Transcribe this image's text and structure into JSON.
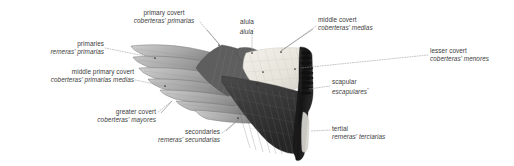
{
  "figure": {
    "background_color": "#ffffff",
    "text_color": "#3c3c3c",
    "leader_line_color": "#9a9a9a",
    "wing_colors": {
      "primaries_light": "#b9b9b9",
      "primaries_mid": "#9a9a9a",
      "primaries_dark": "#6f6f6f",
      "covert_panel": "#e8e6df",
      "secondaries_dark": "#3a3a3a",
      "tertial_dark": "#222222",
      "scapular_dark": "#1c1c1c",
      "alula_dark": "#5a5a5a"
    }
  },
  "labels": [
    {
      "id": "primary-covert",
      "en": "primary covert",
      "es": "coberteras' primarias",
      "align": "center",
      "x": 130,
      "y": 10,
      "anchor_x": 224,
      "anchor_y": 47
    },
    {
      "id": "alula",
      "en": "alula",
      "es": "álula",
      "es_sup": "'",
      "align": "center",
      "x": 228,
      "y": 19,
      "anchor_x": 252,
      "anchor_y": 53
    },
    {
      "id": "middle-covert",
      "en": "middle covert",
      "es": "coberteras' medias",
      "align": "left",
      "x": 318,
      "y": 17,
      "anchor_x": 278,
      "anchor_y": 52
    },
    {
      "id": "primaries",
      "en": "primaries",
      "es": "remeras' primarias",
      "align": "right",
      "x": 14,
      "y": 41,
      "anchor_x": 155,
      "anchor_y": 59
    },
    {
      "id": "lesser-covert",
      "en": "lesser covert",
      "es": "coberteras' menores",
      "align": "left",
      "x": 430,
      "y": 48,
      "anchor_x": 300,
      "anchor_y": 69
    },
    {
      "id": "middle-primary-covert",
      "en": "middle primary covert",
      "es": "coberteras' primarias medias",
      "align": "right",
      "x": 42,
      "y": 70,
      "anchor_x": 162,
      "anchor_y": 86
    },
    {
      "id": "scapular",
      "en": "scapular",
      "es": "escapulares",
      "es_sup": "*",
      "align": "left",
      "x": 332,
      "y": 79,
      "anchor_x": 307,
      "anchor_y": 89
    },
    {
      "id": "greater-covert",
      "en": "greater covert",
      "es": "coberteras' mayores",
      "align": "right",
      "x": 70,
      "y": 110,
      "anchor_x": 170,
      "anchor_y": 100
    },
    {
      "id": "secondaries",
      "en": "secondaries",
      "es": "remeras' secundarias",
      "align": "right",
      "x": 140,
      "y": 130,
      "anchor_x": 238,
      "anchor_y": 118
    },
    {
      "id": "tertial",
      "en": "tertial",
      "es": "remeras' terciarias",
      "align": "left",
      "x": 332,
      "y": 126,
      "anchor_x": 310,
      "anchor_y": 132
    }
  ]
}
